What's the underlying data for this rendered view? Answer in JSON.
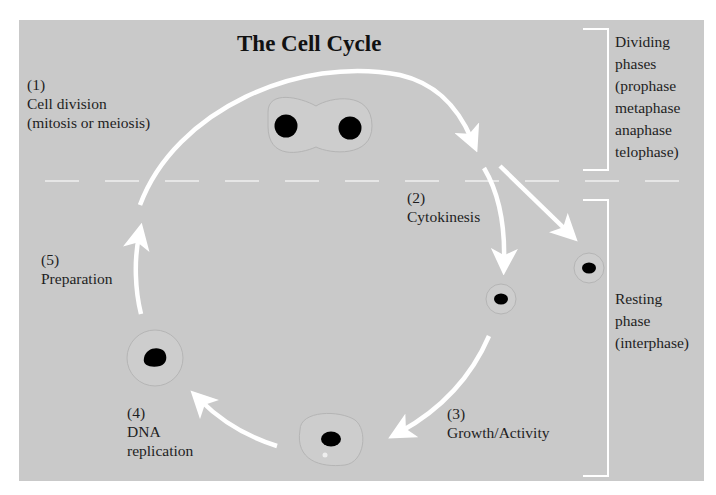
{
  "title": "The Cell Cycle",
  "steps": [
    {
      "num": "(1)",
      "label": "Cell division",
      "sub": "(mitosis or meiosis)"
    },
    {
      "num": "(2)",
      "label": "Cytokinesis"
    },
    {
      "num": "(3)",
      "label": "Growth/Activity"
    },
    {
      "num": "(4)",
      "label": "DNA",
      "sub": "replication"
    },
    {
      "num": "(5)",
      "label": "Preparation"
    }
  ],
  "brackets": {
    "dividing": {
      "lines": [
        "Dividing",
        "phases",
        "(prophase",
        "metaphase",
        "anaphase",
        "telophase)"
      ]
    },
    "resting": {
      "lines": [
        "Resting",
        "phase",
        "(interphase)"
      ]
    }
  },
  "colors": {
    "background": "#c9c9c9",
    "arrows": "#ffffff",
    "nucleus": "#000000",
    "text": "#1e1e1e"
  }
}
